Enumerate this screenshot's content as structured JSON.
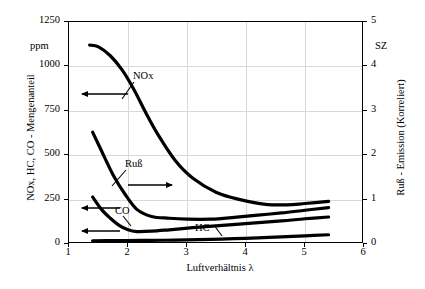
{
  "chart_data": {
    "type": "line",
    "title": "",
    "subtitle": "",
    "xlabel": "Luftverhältnis λ",
    "ylabel": "NOx, HC, CO - Mengenanteil",
    "ylabel_right": "Ruß - Emission (Korreliert)",
    "yunit": "ppm",
    "yunit_right": "SZ",
    "xlim": [
      1,
      6
    ],
    "ylim": [
      0,
      1250
    ],
    "ylim_right": [
      0,
      5
    ],
    "xticks": [
      "1",
      "2",
      "3",
      "4",
      "5",
      "6"
    ],
    "yticks": [
      "0",
      "250",
      "500",
      "750",
      "1000",
      "1250"
    ],
    "yticks_right": [
      "0",
      "1",
      "2",
      "3",
      "4",
      "5"
    ],
    "grid": true,
    "legend": "none",
    "annotations": [
      {
        "text": "NOx",
        "axis": "left",
        "arrow": "left"
      },
      {
        "text": "Ruß",
        "axis": "right",
        "arrow": "right"
      },
      {
        "text": "CO",
        "axis": "left",
        "arrow": "left"
      },
      {
        "text": "HC",
        "axis": "left",
        "arrow": "left"
      }
    ],
    "series": [
      {
        "name": "NOx",
        "axis": "left",
        "unit": "ppm",
        "x": [
          1.35,
          1.5,
          1.7,
          1.9,
          2.1,
          2.3,
          2.5,
          2.8,
          3.1,
          3.5,
          3.9,
          4.3,
          4.7,
          5.0,
          5.4
        ],
        "values": [
          1120,
          1110,
          1060,
          980,
          870,
          740,
          620,
          470,
          370,
          290,
          250,
          225,
          220,
          228,
          240
        ]
      },
      {
        "name": "Ruß",
        "axis": "right",
        "unit": "SZ",
        "x": [
          1.4,
          1.55,
          1.75,
          1.95,
          2.15,
          2.4,
          2.7,
          3.0,
          3.4,
          3.8,
          4.2,
          4.6,
          5.0,
          5.4
        ],
        "values": [
          2.52,
          2.1,
          1.55,
          1.12,
          0.78,
          0.62,
          0.58,
          0.56,
          0.56,
          0.6,
          0.65,
          0.7,
          0.76,
          0.82
        ],
        "values_ppm_equivalent": [
          630,
          525,
          388,
          280,
          195,
          155,
          145,
          140,
          140,
          150,
          163,
          175,
          190,
          205
        ]
      },
      {
        "name": "CO",
        "axis": "left",
        "unit": "ppm",
        "x": [
          1.4,
          1.55,
          1.7,
          1.85,
          2.0,
          2.15,
          2.4,
          2.7,
          3.1,
          3.6,
          4.1,
          4.6,
          5.0,
          5.4
        ],
        "values": [
          265,
          195,
          145,
          105,
          80,
          70,
          72,
          80,
          92,
          105,
          118,
          130,
          142,
          152
        ]
      },
      {
        "name": "HC",
        "axis": "left",
        "unit": "ppm",
        "x": [
          1.4,
          1.8,
          2.2,
          2.6,
          3.0,
          3.4,
          3.8,
          4.2,
          4.6,
          5.0,
          5.4
        ],
        "values": [
          18,
          19,
          20,
          21,
          23,
          26,
          30,
          35,
          40,
          46,
          52
        ]
      }
    ]
  }
}
